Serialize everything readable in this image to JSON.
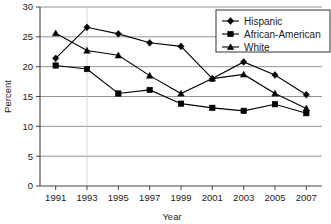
{
  "chart_data": {
    "type": "line",
    "title": "",
    "xlabel": "Year",
    "ylabel": "Percent",
    "categories": [
      "1991",
      "1993",
      "1995",
      "1997",
      "1999",
      "2001",
      "2003",
      "2005",
      "2007"
    ],
    "x": [
      1991,
      1993,
      1995,
      1997,
      1999,
      2001,
      2003,
      2005,
      2007
    ],
    "xlim": [
      1990,
      2008
    ],
    "ylim": [
      0,
      30
    ],
    "ytick_labels": [
      "0",
      "5",
      "10",
      "15",
      "20",
      "25",
      "30"
    ],
    "yticks": [
      0,
      5,
      10,
      15,
      20,
      25,
      30
    ],
    "grid": "horizontal",
    "legend_position": "top-right",
    "series": [
      {
        "name": "Hispanic",
        "marker": "diamond",
        "values": [
          21.4,
          26.6,
          25.5,
          24.0,
          23.4,
          18.0,
          20.8,
          18.6,
          15.3
        ]
      },
      {
        "name": "African-American",
        "marker": "square",
        "values": [
          20.2,
          19.6,
          15.5,
          16.1,
          13.8,
          13.1,
          12.6,
          13.7,
          12.2
        ]
      },
      {
        "name": "White",
        "marker": "triangle",
        "values": [
          25.6,
          22.7,
          21.9,
          18.5,
          15.5,
          18.0,
          18.7,
          15.5,
          13.0
        ]
      }
    ]
  },
  "legend": {
    "items": [
      {
        "label": "Hispanic"
      },
      {
        "label": "African-American"
      },
      {
        "label": "White"
      }
    ]
  },
  "axes": {
    "y_title": "Percent",
    "x_title": "Year"
  },
  "colors": {
    "series": "#000000",
    "grid": "#888888",
    "axis": "#444444",
    "background": "#ffffff"
  }
}
